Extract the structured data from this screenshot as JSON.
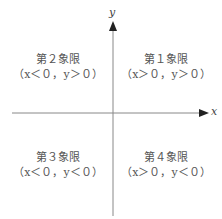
{
  "axes": {
    "x_label": "x",
    "y_label": "y",
    "line_color": "#888888"
  },
  "quadrants": [
    {
      "name": "第２象限",
      "condition": "（x＜０，y＞０）"
    },
    {
      "name": "第１象限",
      "condition": "（x＞０，y＞０）"
    },
    {
      "name": "第３象限",
      "condition": "（x＜０，y＜０）"
    },
    {
      "name": "第４象限",
      "condition": "（x＞０，y＜０）"
    }
  ]
}
